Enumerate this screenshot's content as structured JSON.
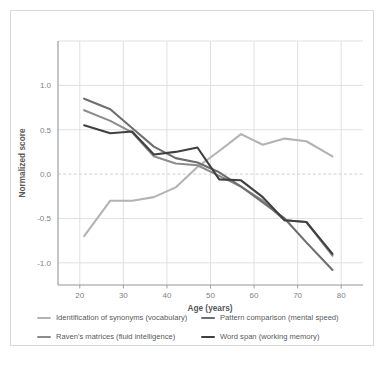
{
  "chart_data": {
    "type": "line",
    "title": "",
    "xlabel": "Age (years)",
    "ylabel": "Normalized score",
    "xlim": [
      15,
      85
    ],
    "ylim": [
      -1.25,
      1.5
    ],
    "xticks": [
      20,
      30,
      40,
      50,
      60,
      70,
      80
    ],
    "yticks": [
      1.0,
      0.5,
      0.0,
      -0.5,
      -1.0
    ],
    "ytick_labels": [
      "1.0",
      "0.5",
      "0.0",
      "-0.5",
      "-1.0"
    ],
    "xtick_labels": [
      "20",
      "30",
      "40",
      "50",
      "60",
      "70",
      "80"
    ],
    "grid": "horizontal",
    "zero_line": "dashed",
    "legend_position": "below",
    "series": [
      {
        "name": "Identification of synonyms (vocabulary)",
        "color": "#b3b3b3",
        "x": [
          21,
          27,
          32,
          37,
          42,
          47,
          52,
          57,
          62,
          67,
          72,
          78
        ],
        "values": [
          -0.7,
          -0.3,
          -0.3,
          -0.26,
          -0.15,
          0.08,
          0.26,
          0.45,
          0.33,
          0.4,
          0.37,
          0.2
        ]
      },
      {
        "name": "Raven's matrices (fluid intelligence)",
        "color": "#8c8c8c",
        "x": [
          21,
          27,
          32,
          37,
          42,
          47,
          52,
          57,
          62,
          67,
          72,
          78
        ],
        "values": [
          0.72,
          0.6,
          0.47,
          0.2,
          0.12,
          0.1,
          -0.02,
          -0.14,
          -0.3,
          -0.52,
          -0.54,
          -0.92
        ]
      },
      {
        "name": "Pattern comparison (mental speed)",
        "color": "#6d6e71",
        "x": [
          21,
          27,
          32,
          37,
          42,
          47,
          52,
          57,
          62,
          67,
          72,
          78
        ],
        "values": [
          0.85,
          0.73,
          0.52,
          0.31,
          0.18,
          0.13,
          0.02,
          -0.14,
          -0.32,
          -0.5,
          -0.77,
          -1.08
        ]
      },
      {
        "name": "Word span (working memory)",
        "color": "#404040",
        "x": [
          21,
          27,
          32,
          37,
          42,
          47,
          52,
          57,
          62,
          67,
          72,
          78
        ],
        "values": [
          0.55,
          0.46,
          0.48,
          0.22,
          0.25,
          0.3,
          -0.06,
          -0.07,
          -0.26,
          -0.52,
          -0.54,
          -0.9
        ]
      }
    ]
  },
  "legend": {
    "items": [
      {
        "label": "Identification of synonyms (vocabulary)",
        "color": "#b3b3b3"
      },
      {
        "label": "Pattern comparison (mental speed)",
        "color": "#6d6e71"
      },
      {
        "label": "Raven's matrices (fluid intelligence)",
        "color": "#8c8c8c"
      },
      {
        "label": "Word span (working memory)",
        "color": "#404040"
      }
    ]
  },
  "axes": {
    "x_title": "Age (years)",
    "y_title": "Normalized score"
  }
}
